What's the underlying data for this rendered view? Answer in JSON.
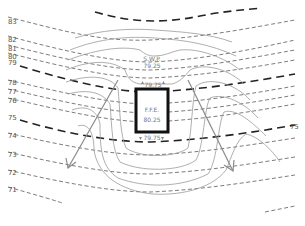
{
  "diagram": {
    "type": "site-grading-contour-plan",
    "colors": {
      "existing_contour": "#444444",
      "existing_index_contour": "#222222",
      "proposed_contour": "#9a9a9a",
      "building": "#111111",
      "drainage_arrow": "#8a8a8a",
      "label": "#555555"
    },
    "existing_contour_labels_left": [
      {
        "value": "83",
        "y": 22
      },
      {
        "value": "82",
        "y": 40
      },
      {
        "value": "81",
        "y": 49
      },
      {
        "value": "80",
        "y": 57
      },
      {
        "value": "79",
        "y": 63
      },
      {
        "value": "78",
        "y": 83
      },
      {
        "value": "77",
        "y": 92
      },
      {
        "value": "76",
        "y": 101
      },
      {
        "value": "75",
        "y": 118
      },
      {
        "value": "74",
        "y": 136
      },
      {
        "value": "73",
        "y": 155
      },
      {
        "value": "72",
        "y": 173
      },
      {
        "value": "71",
        "y": 190
      }
    ],
    "existing_contour_label_right": {
      "value": "75",
      "y": 128
    },
    "building": {
      "label": "F.F.E.",
      "elevation": "80.25"
    },
    "spot_elevations": {
      "top_label": "S.W.P.",
      "top_value": "79.25",
      "upper_door": "79.75",
      "lower_door": "79.75"
    },
    "drainage_arrows": [
      {
        "name": "left-swale",
        "direction": "southwest"
      },
      {
        "name": "right-swale",
        "direction": "southeast"
      }
    ]
  }
}
